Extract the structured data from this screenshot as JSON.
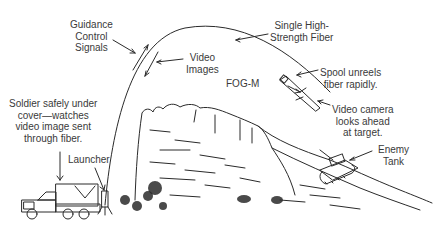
{
  "diagram": {
    "labels": {
      "guidance": [
        "Guidance",
        "Control",
        "Signals"
      ],
      "fiber": [
        "Single High-",
        "Strength Fiber"
      ],
      "video": [
        "Video",
        "Images"
      ],
      "fogm": "FOG-M",
      "spool": [
        "Spool unreels",
        "fiber rapidly."
      ],
      "camera": [
        "Video camera",
        "looks ahead",
        "at target."
      ],
      "soldier": [
        "Soldier safely under",
        "cover—watches",
        "video image sent",
        "through fiber."
      ],
      "launcher": "Launcher",
      "tank": [
        "Enemy",
        "Tank"
      ]
    },
    "colors": {
      "line": "#2a2a2a",
      "text": "#3a3a3a",
      "background": "#ffffff"
    }
  }
}
